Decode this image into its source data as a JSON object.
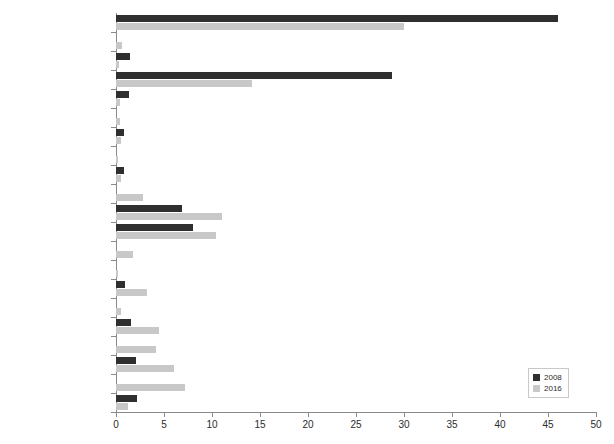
{
  "chart_data": {
    "type": "bar",
    "orientation": "horizontal",
    "title": "",
    "xlabel": "",
    "ylabel": "",
    "xlim": [
      0,
      50
    ],
    "xticks": [
      0,
      5,
      10,
      15,
      20,
      25,
      30,
      35,
      40,
      45,
      50
    ],
    "grid": false,
    "legend_position": "bottom-right",
    "categories": [
      "Bar",
      "Building services",
      "Business services",
      "Car wash",
      "Church",
      "Clothes makers",
      "Community services",
      "Entertainment",
      "Fish shops",
      "Greengrocers",
      "Hair salons",
      "House shops",
      "Meat sellers",
      "Micro-manufacturers",
      "Print shops",
      "Restaurants",
      "Street braais",
      "Street trade",
      "Takeaways",
      "Vechicle services",
      "Miscellaneous"
    ],
    "series": [
      {
        "name": "2008",
        "color": "#2f2f2f",
        "values": [
          46.0,
          0.0,
          1.5,
          28.8,
          1.4,
          0.0,
          0.8,
          0.0,
          0.8,
          0.0,
          6.9,
          8.0,
          0.0,
          0.0,
          0.9,
          0.0,
          1.6,
          0.0,
          2.1,
          0.0,
          2.2
        ]
      },
      {
        "name": "2016",
        "color": "#c8c8c8",
        "values": [
          30.0,
          0.6,
          0.3,
          14.2,
          0.4,
          0.4,
          0.5,
          0.2,
          0.5,
          2.8,
          11.0,
          10.4,
          1.8,
          0.2,
          3.2,
          0.5,
          4.5,
          4.2,
          6.0,
          7.2,
          1.2
        ]
      }
    ]
  },
  "legend": {
    "entries": [
      {
        "label": "2008",
        "swatch": "s2008"
      },
      {
        "label": "2016",
        "swatch": "s2016"
      }
    ]
  }
}
